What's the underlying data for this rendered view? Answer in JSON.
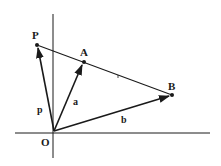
{
  "diagram": {
    "points": [
      {
        "id": "O",
        "label": "O"
      },
      {
        "id": "P",
        "label": "P"
      },
      {
        "id": "A",
        "label": "A"
      },
      {
        "id": "B",
        "label": "B"
      }
    ],
    "vectors": [
      {
        "from": "O",
        "to": "P",
        "label": "p"
      },
      {
        "from": "O",
        "to": "A",
        "label": "a"
      },
      {
        "from": "O",
        "to": "B",
        "label": "b"
      }
    ],
    "lines": [
      {
        "through": [
          "P",
          "A",
          "B"
        ],
        "description": "straight line containing P, A and B"
      }
    ],
    "axes": {
      "horizontal": true,
      "vertical": true,
      "origin_label": "O"
    },
    "colors": {
      "ink": "#1a1a1a",
      "background": "#ffffff"
    }
  }
}
